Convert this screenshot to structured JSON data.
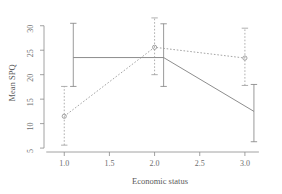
{
  "chart_data": {
    "type": "line",
    "title": "",
    "xlabel": "Economic status",
    "ylabel": "Mean SPQ",
    "x": [
      1,
      2,
      3
    ],
    "xlim": [
      0.82,
      3.3
    ],
    "ylim": [
      4.2,
      32.4
    ],
    "xticks": [
      1.0,
      1.5,
      2.0,
      2.5,
      3.0
    ],
    "xticklabels": [
      "1.0",
      "1.5",
      "2.0",
      "2.5",
      "3.0"
    ],
    "yticks": [
      5,
      10,
      15,
      20,
      25,
      30
    ],
    "yticklabels": [
      "5",
      "10",
      "15",
      "20",
      "25",
      "30"
    ],
    "grid": false,
    "legend": "none",
    "series": [
      {
        "name": "solid-series",
        "linestyle": "solid",
        "marker": "none",
        "color": "#808080",
        "x_offset": 0.1,
        "values": [
          23.5,
          23.5,
          12.5
        ],
        "err_low": [
          17.6,
          17.6,
          6.3
        ],
        "err_high": [
          30.5,
          30.4,
          18.0
        ]
      },
      {
        "name": "dotted-series",
        "linestyle": "dotted",
        "marker": "circle",
        "color": "#9a9a9a",
        "x_offset": 0.0,
        "values": [
          11.5,
          25.6,
          23.4
        ],
        "err_low": [
          5.6,
          20.0,
          17.8
        ],
        "err_high": [
          17.6,
          31.6,
          29.5
        ]
      }
    ]
  },
  "axis": {
    "x_tick_count": 5,
    "y_tick_count": 6
  }
}
